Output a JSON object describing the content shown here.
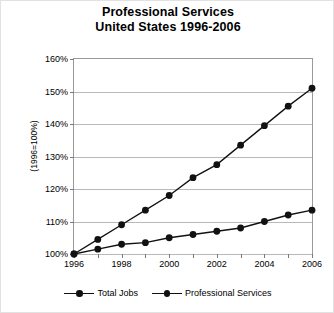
{
  "title": {
    "line1": "Professional Services",
    "line2": "United States 1996-2006"
  },
  "axes": {
    "ylabel": "(1996=100%)",
    "yticks": [
      "100%",
      "110%",
      "120%",
      "130%",
      "140%",
      "150%",
      "160%"
    ],
    "xticks": [
      "1996",
      "1998",
      "2000",
      "2002",
      "2004",
      "2006"
    ]
  },
  "legend": {
    "items": [
      {
        "label": "Total Jobs",
        "color": "#111111"
      },
      {
        "label": "Professional Services",
        "color": "#111111"
      }
    ]
  },
  "chart_data": {
    "type": "line",
    "title": "Professional Services United States 1996-2006",
    "xlabel": "",
    "ylabel": "(1996=100%)",
    "x": [
      1996,
      1997,
      1998,
      1999,
      2000,
      2001,
      2002,
      2003,
      2004,
      2005,
      2006
    ],
    "xlim": [
      1996,
      2006
    ],
    "ylim": [
      100,
      160
    ],
    "ytick_values": [
      100,
      110,
      120,
      130,
      140,
      150,
      160
    ],
    "xtick_values": [
      1996,
      1998,
      2000,
      2002,
      2004,
      2006
    ],
    "grid": "horizontal",
    "legend_position": "bottom",
    "marker": "filled-circle",
    "series": [
      {
        "name": "Total Jobs",
        "color": "#111111",
        "values": [
          100,
          101.5,
          103,
          103.5,
          105,
          106,
          107,
          108,
          110,
          112,
          113.5
        ]
      },
      {
        "name": "Professional Services",
        "color": "#111111",
        "values": [
          100,
          104.5,
          109,
          113.5,
          118,
          123.5,
          127.5,
          133.5,
          139.5,
          145.5,
          151
        ]
      }
    ]
  }
}
